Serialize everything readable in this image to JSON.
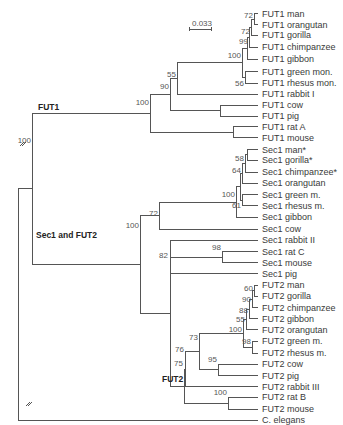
{
  "figure": {
    "type": "phylogenetic-tree",
    "scale_bar_label": "0.033",
    "clade_labels": {
      "fut1": "FUT1",
      "sec1_fut2": "Sec1 and FUT2",
      "fut2": "FUT2"
    },
    "leaves": [
      "FUT1 man",
      "FUT1 orangutan",
      "FUT1 gorilla",
      "FUT1 chimpanzee",
      "FUT1 gibbon",
      "FUT1 green mon.",
      "FUT1 rhesus mon.",
      "FUT1 rabbit I",
      "FUT1 cow",
      "FUT1 pig",
      "FUT1 rat A",
      "FUT1 mouse",
      "Sec1 man*",
      "Sec1 gorilla*",
      "Sec1 chimpanzee*",
      "Sec1 orangutan",
      "Sec1 green m.",
      "Sec1 rhesus m.",
      "Sec1 gibbon",
      "Sec1 cow",
      "Sec1 rabbit II",
      "Sec1 rat C",
      "Sec1 mouse",
      "Sec1 pig",
      "FUT2 man",
      "FUT2 gorilla",
      "FUT2 chimpanzee",
      "FUT2 gibbon",
      "FUT2 orangutan",
      "FUT2 green m.",
      "FUT2 rhesus m.",
      "FUT2 cow",
      "FUT2 pig",
      "FUT2 rabbit III",
      "FUT2 rat B",
      "FUT2 mouse",
      "C. elegans"
    ],
    "bootstrap": {
      "root": "100",
      "fut1_clade": "100",
      "fut1_90": "90",
      "fut1_55": "55",
      "fut1_primate_old_world": "100",
      "fut1_99": "99",
      "fut1_72_gorilla": "72",
      "fut1_72_man": "72",
      "fut1_56": "56",
      "sec1_fut2": "100",
      "sec1_72": "72",
      "sec1_primates": "100",
      "sec1_64": "64",
      "sec1_58": "58",
      "sec1_61": "61",
      "sec1_82": "82",
      "sec1_98": "98",
      "fut2_75": "75",
      "fut2_76": "76",
      "fut2_73": "73",
      "fut2_primates": "100",
      "fut2_55": "55",
      "fut2_88": "88",
      "fut2_90": "90",
      "fut2_60": "60",
      "fut2_98": "98",
      "fut2_95": "95",
      "fut2_rodents": "100"
    }
  }
}
